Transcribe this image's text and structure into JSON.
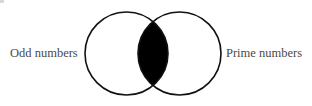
{
  "diagram": {
    "type": "venn",
    "sets": [
      {
        "label": "Odd numbers",
        "cx": 126.5,
        "cy": 53.5,
        "r": 41.5
      },
      {
        "label": "Prime numbers",
        "cx": 179.5,
        "cy": 53.5,
        "r": 41.5
      }
    ],
    "shaded_region": "intersection",
    "colors": {
      "outline": "#111111",
      "shade": "#000000",
      "label_text": "#4a4a4a",
      "background": "#ffffff"
    }
  }
}
